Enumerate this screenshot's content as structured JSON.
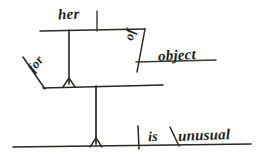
{
  "diagram": {
    "kind": "reed-kellogg-sentence-diagram",
    "colors": {
      "background": "#fffffd",
      "ink": "#2a2724",
      "ink_light": "#4a4643"
    },
    "words": {
      "modifier_top": "her",
      "preposition": "of",
      "object_of_preposition": "object",
      "modifier_left": "for",
      "linking_verb": "is",
      "predicate_adjective": "unusual"
    },
    "marks": {
      "predicate_adjective_slash": "\\",
      "subject_predicate_bar": "|"
    },
    "lines": [
      {
        "name": "upper-baseline",
        "x1": 40,
        "y1": 31,
        "x2": 145,
        "y2": 29
      },
      {
        "name": "upper-subject-divider",
        "x1": 97,
        "y1": 11,
        "x2": 97,
        "y2": 31
      },
      {
        "name": "upper-stem",
        "x1": 69,
        "y1": 30,
        "x2": 69,
        "y2": 85
      },
      {
        "name": "prepositional-diagonal",
        "x1": 145,
        "y1": 29,
        "x2": 137,
        "y2": 72
      },
      {
        "name": "object-baseline",
        "x1": 137,
        "y1": 62,
        "x2": 215,
        "y2": 60
      },
      {
        "name": "mid-baseline",
        "x1": 43,
        "y1": 88,
        "x2": 162,
        "y2": 85
      },
      {
        "name": "for-diagonal",
        "x1": 23,
        "y1": 58,
        "x2": 45,
        "y2": 89
      },
      {
        "name": "mid-stem",
        "x1": 96,
        "y1": 86,
        "x2": 96,
        "y2": 145
      },
      {
        "name": "bottom-baseline",
        "x1": 13,
        "y1": 147,
        "x2": 250,
        "y2": 144
      },
      {
        "name": "verb-divider",
        "x1": 138,
        "y1": 126,
        "x2": 139,
        "y2": 148
      },
      {
        "name": "predicate-slash",
        "x1": 170,
        "y1": 128,
        "x2": 178,
        "y2": 146
      }
    ],
    "junctions": [
      {
        "name": "upper-junction",
        "x": 69,
        "y": 86
      },
      {
        "name": "bottom-junction",
        "x": 96,
        "y": 146
      }
    ]
  }
}
